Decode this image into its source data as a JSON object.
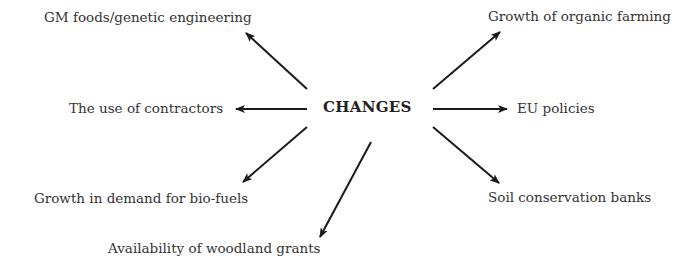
{
  "diagram": {
    "center": {
      "label": "CHANGES"
    },
    "nodes": [
      {
        "id": "gm",
        "label": "GM foods/genetic engineering"
      },
      {
        "id": "contractors",
        "label": "The use of contractors"
      },
      {
        "id": "biofuels",
        "label": "Growth in demand for bio-fuels"
      },
      {
        "id": "woodland",
        "label": "Availability of woodland grants"
      },
      {
        "id": "organic",
        "label": "Growth of organic farming"
      },
      {
        "id": "eu",
        "label": "EU policies"
      },
      {
        "id": "soil",
        "label": "Soil conservation banks"
      }
    ],
    "edges": [
      {
        "from": "CHANGES",
        "to": "gm"
      },
      {
        "from": "CHANGES",
        "to": "contractors"
      },
      {
        "from": "CHANGES",
        "to": "biofuels"
      },
      {
        "from": "CHANGES",
        "to": "woodland"
      },
      {
        "from": "CHANGES",
        "to": "organic"
      },
      {
        "from": "CHANGES",
        "to": "eu"
      },
      {
        "from": "CHANGES",
        "to": "soil"
      }
    ],
    "colors": {
      "arrow": "#1a1a1a",
      "text": "#333333"
    }
  }
}
